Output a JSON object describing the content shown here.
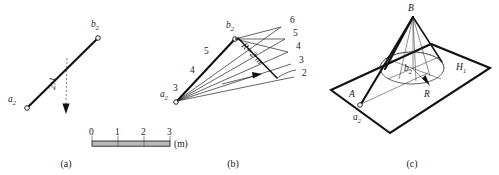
{
  "figure": {
    "title_caption_a": "(a)",
    "title_caption_b": "(b)",
    "title_caption_c": "(c)"
  },
  "panel_a": {
    "point_start_label": "a",
    "point_start_sub": "2",
    "point_end_label": "b",
    "point_end_sub": "2",
    "slope_label": "2:1",
    "scale": {
      "ticks": [
        "0",
        "1",
        "2",
        "3"
      ],
      "unit": "(m)"
    }
  },
  "panel_b": {
    "point_start_label": "a",
    "point_start_sub": "2",
    "point_end_label": "b",
    "point_end_sub": "2",
    "interval_label": "R=2 m",
    "left_numbers": [
      "5",
      "4",
      "3"
    ],
    "right_numbers": [
      "6",
      "5",
      "4",
      "3",
      "2"
    ]
  },
  "panel_c": {
    "apex_label": "B",
    "point_a_upper": "A",
    "point_a_lower_label": "a",
    "point_a_lower_sub": "2",
    "center_label": "b",
    "center_sub": "2",
    "radius_label": "R",
    "plane_label": "H",
    "plane_sub": "1"
  },
  "colors": {
    "ink": "#111111",
    "scale_fill": "#b9b9b9",
    "paper": "#ffffff"
  }
}
